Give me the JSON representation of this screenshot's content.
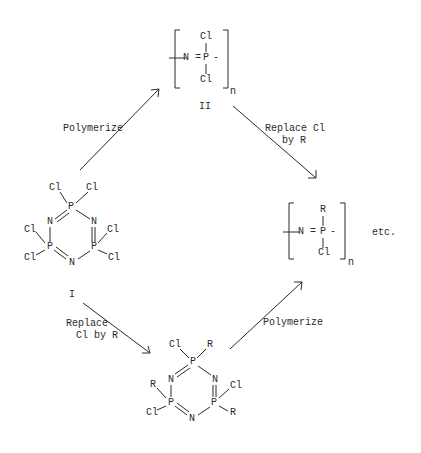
{
  "diagram": {
    "type": "chemical reaction scheme",
    "structures": {
      "I": {
        "label": "I",
        "atoms": {
          "cl_tl": "Cl",
          "cl_tr": "Cl",
          "p_top": "P",
          "n_left": "N",
          "n_right": "N",
          "cl_ml": "Cl",
          "cl_mr": "Cl",
          "p_left": "P",
          "p_right": "P",
          "cl_bl": "Cl",
          "cl_br": "Cl",
          "n_bottom": "N"
        }
      },
      "II": {
        "label": "II",
        "top": "Cl",
        "center": "P",
        "bottom": "Cl",
        "left_group": "N =",
        "right_dash": "-",
        "subscript": "n"
      },
      "product_polymer": {
        "top": "R",
        "center": "P",
        "bottom": "Cl",
        "left_group": "N =",
        "right_dash": "-",
        "subscript": "n",
        "suffix": "etc."
      },
      "substituted_trimer": {
        "atoms": {
          "cl_top": "Cl",
          "r_top": "R",
          "p_top": "P",
          "n_left": "N",
          "n_right": "N",
          "r_left": "R",
          "cl_right": "Cl",
          "p_left": "P",
          "p_right": "P",
          "cl_left": "Cl",
          "r_right": "R",
          "n_bottom": "N"
        }
      }
    },
    "arrows": [
      {
        "id": "polymerize-top",
        "label": "Polymerize",
        "from": "I",
        "to": "II"
      },
      {
        "id": "replace-top",
        "label_line1": "Replace Cl",
        "label_line2": "by R",
        "from": "II",
        "to": "product_polymer"
      },
      {
        "id": "replace-bottom",
        "label_line1": "Replace",
        "label_line2": "Cl by R",
        "from": "I",
        "to": "substituted_trimer"
      },
      {
        "id": "polymerize-bottom",
        "label": "Polymerize",
        "from": "substituted_trimer",
        "to": "product_polymer"
      }
    ]
  }
}
